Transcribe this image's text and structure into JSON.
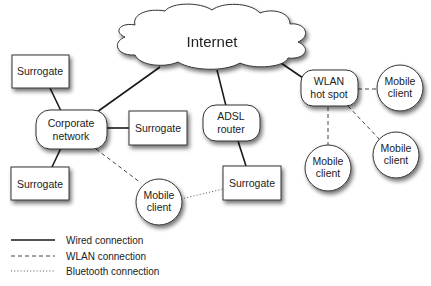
{
  "diagram": {
    "title": "",
    "nodes": {
      "internet": {
        "label": "Internet",
        "shape": "cloud"
      },
      "surrogate_top_left": {
        "label": "Surrogate",
        "shape": "rectangle"
      },
      "corporate_network": {
        "line1": "Corporate",
        "line2": "network",
        "shape": "rounded-rectangle"
      },
      "surrogate_mid": {
        "label": "Surrogate",
        "shape": "rectangle"
      },
      "surrogate_bottom_left": {
        "label": "Surrogate",
        "shape": "rectangle"
      },
      "adsl_router": {
        "line1": "ADSL",
        "line2": "router",
        "shape": "rounded-rectangle"
      },
      "surrogate_adsl": {
        "label": "Surrogate",
        "shape": "rectangle"
      },
      "mobile_client_bluetooth": {
        "line1": "Mobile",
        "line2": "client",
        "shape": "circle"
      },
      "wlan_hot_spot": {
        "line1": "WLAN",
        "line2": "hot spot",
        "shape": "rounded-rectangle"
      },
      "mobile_client_right": {
        "line1": "Mobile",
        "line2": "client",
        "shape": "circle"
      },
      "mobile_client_below": {
        "line1": "Mobile",
        "line2": "client",
        "shape": "circle"
      },
      "mobile_client_lower_right": {
        "line1": "Mobile",
        "line2": "client",
        "shape": "circle"
      }
    },
    "edges": [
      {
        "from": "internet",
        "to": "corporate_network",
        "type": "wired"
      },
      {
        "from": "internet",
        "to": "adsl_router",
        "type": "wired"
      },
      {
        "from": "internet",
        "to": "wlan_hot_spot",
        "type": "wired"
      },
      {
        "from": "surrogate_top_left",
        "to": "corporate_network",
        "type": "wired"
      },
      {
        "from": "corporate_network",
        "to": "surrogate_mid",
        "type": "wired"
      },
      {
        "from": "corporate_network",
        "to": "surrogate_bottom_left",
        "type": "wired"
      },
      {
        "from": "corporate_network",
        "to": "mobile_client_bluetooth",
        "type": "wlan"
      },
      {
        "from": "adsl_router",
        "to": "surrogate_adsl",
        "type": "wired"
      },
      {
        "from": "mobile_client_bluetooth",
        "to": "surrogate_adsl",
        "type": "bluetooth"
      },
      {
        "from": "wlan_hot_spot",
        "to": "mobile_client_right",
        "type": "wlan"
      },
      {
        "from": "wlan_hot_spot",
        "to": "mobile_client_below",
        "type": "wlan"
      },
      {
        "from": "wlan_hot_spot",
        "to": "mobile_client_lower_right",
        "type": "wlan"
      }
    ]
  },
  "legend": {
    "items": [
      {
        "label": "Wired connection",
        "style": "solid"
      },
      {
        "label": "WLAN connection",
        "style": "dashed"
      },
      {
        "label": "Bluetooth connection",
        "style": "dotted"
      }
    ]
  },
  "colors": {
    "stroke": "#333333",
    "fill": "#ffffff",
    "text": "#222222",
    "background": "#ffffff"
  }
}
